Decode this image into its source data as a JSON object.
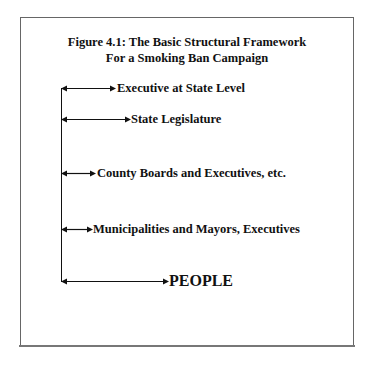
{
  "figure": {
    "title_line1": "Figure 4.1: The Basic Structural Framework",
    "title_line2": "For a Smoking Ban Campaign"
  },
  "levels": [
    {
      "label": "Executive at State Level"
    },
    {
      "label": "State Legislature"
    },
    {
      "label": "County Boards and Executives, etc."
    },
    {
      "label": "Municipalities and Mayors, Executives"
    },
    {
      "label": "PEOPLE"
    }
  ],
  "colors": {
    "line": "#111111",
    "frame": "#666666",
    "background": "#ffffff"
  }
}
